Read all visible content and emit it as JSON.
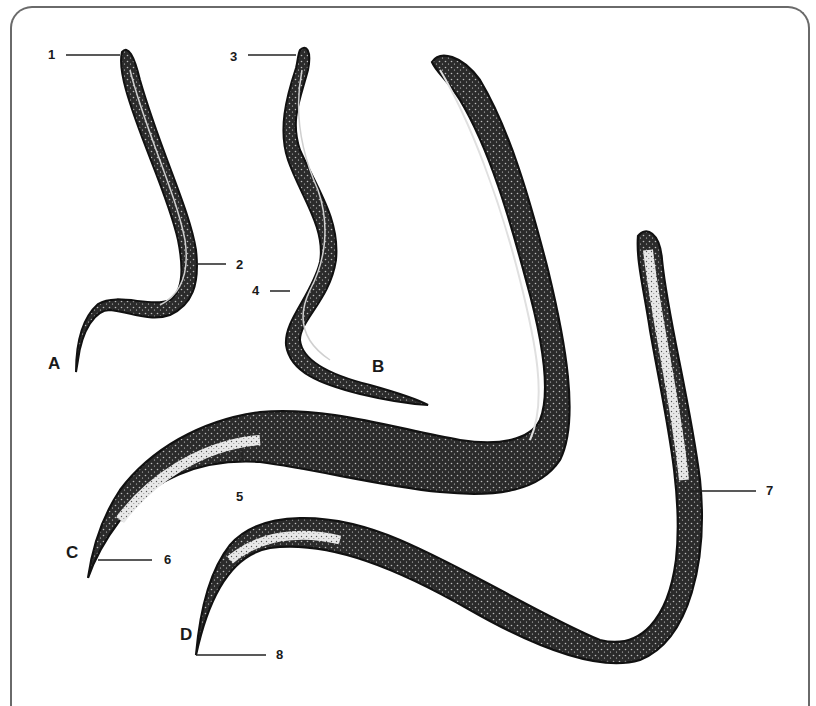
{
  "figure": {
    "type": "scientific-illustration",
    "specimens": [
      {
        "id": "A",
        "label": "A"
      },
      {
        "id": "B",
        "label": "B"
      },
      {
        "id": "C",
        "label": "C"
      },
      {
        "id": "D",
        "label": "D"
      }
    ],
    "callouts": [
      {
        "number": "1",
        "specimen": "A",
        "position": "anterior end"
      },
      {
        "number": "2",
        "specimen": "A",
        "position": "mid-body"
      },
      {
        "number": "3",
        "specimen": "B",
        "position": "anterior end"
      },
      {
        "number": "4",
        "specimen": "B",
        "position": "mid-body"
      },
      {
        "number": "5",
        "specimen": "C",
        "position": "posterior body"
      },
      {
        "number": "6",
        "specimen": "C",
        "position": "tail tip"
      },
      {
        "number": "7",
        "specimen": "D",
        "position": "anterior body"
      },
      {
        "number": "8",
        "specimen": "D",
        "position": "tail tip"
      }
    ],
    "colors": {
      "ink": "#1a1a1a",
      "body_fill": "#2b2b2b",
      "frame": "#6a6a6a",
      "background": "#ffffff"
    }
  }
}
